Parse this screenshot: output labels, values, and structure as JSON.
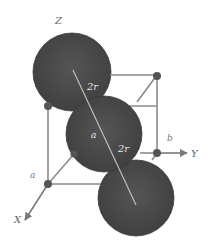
{
  "diagram": {
    "title": "",
    "type": "crystal-unit-cell",
    "labels": {
      "axis_z": "Z",
      "axis_x": "X",
      "axis_y": "Y",
      "edge_a_left": "a",
      "edge_a_center": "a",
      "edge_b": "b",
      "diag_upper": "2r",
      "diag_lower": "2r"
    },
    "colors": {
      "sphere": "#4a4a4a",
      "sphere_edge": "#3a3a3a",
      "edge_line": "#7a7a7a",
      "node": "#555555",
      "diagonal": "#bdbdbd",
      "text_light": "#e8e8e8",
      "text_dark": "#666666"
    },
    "spheres": [
      {
        "name": "top",
        "cx": 72,
        "cy": 72,
        "r": 39
      },
      {
        "name": "middle",
        "cx": 104,
        "cy": 134,
        "r": 38
      },
      {
        "name": "bottom",
        "cx": 136,
        "cy": 198,
        "r": 38
      }
    ],
    "nodes": [
      {
        "name": "back-top-left",
        "cx": 48,
        "cy": 106
      },
      {
        "name": "back-top-right",
        "cx": 157,
        "cy": 76
      },
      {
        "name": "origin",
        "cx": 157,
        "cy": 153
      },
      {
        "name": "front-bottom-left",
        "cx": 48,
        "cy": 184
      },
      {
        "name": "mid-bottom",
        "cx": 74,
        "cy": 154
      }
    ]
  }
}
